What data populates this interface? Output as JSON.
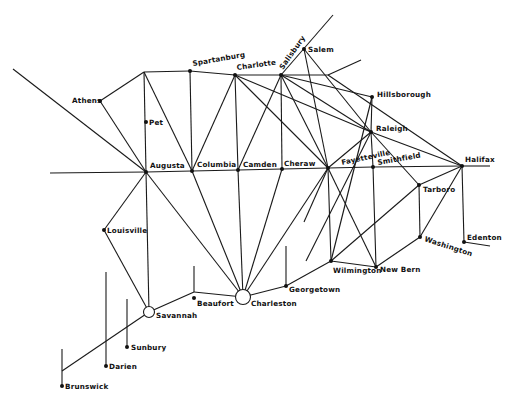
{
  "diagram": {
    "type": "network-map",
    "colors": {
      "line": "#1a1a1a",
      "node": "#111111",
      "background": "#ffffff"
    },
    "nodes": [
      {
        "id": "athens",
        "label": "Athens",
        "x": 100,
        "y": 101,
        "lx": 72,
        "ly": 103,
        "kind": "dot"
      },
      {
        "id": "pet",
        "label": "Pet",
        "x": 146,
        "y": 122,
        "lx": 149,
        "ly": 125,
        "kind": "dot"
      },
      {
        "id": "augusta",
        "label": "Augusta",
        "x": 146,
        "y": 172,
        "lx": 150,
        "ly": 168,
        "kind": "dot"
      },
      {
        "id": "spartanburg",
        "label": "Spartanburg",
        "x": 190,
        "y": 71,
        "lx": 193,
        "ly": 66,
        "kind": "dot",
        "rotate": -10
      },
      {
        "id": "charlotte",
        "label": "Charlotte",
        "x": 235,
        "y": 75,
        "lx": 237,
        "ly": 70,
        "kind": "dot",
        "rotate": -8
      },
      {
        "id": "salisbury",
        "label": "Salisbury",
        "x": 281,
        "y": 75,
        "lx": 283,
        "ly": 70,
        "kind": "dot",
        "rotate": -55
      },
      {
        "id": "salem",
        "label": "Salem",
        "x": 304,
        "y": 49,
        "lx": 308,
        "ly": 52,
        "kind": "dot"
      },
      {
        "id": "hillsborough",
        "label": "Hillsborough",
        "x": 372,
        "y": 97,
        "lx": 377,
        "ly": 97,
        "kind": "dot"
      },
      {
        "id": "raleigh",
        "label": "Raleigh",
        "x": 371,
        "y": 132,
        "lx": 376,
        "ly": 131,
        "kind": "dot"
      },
      {
        "id": "fayetteville",
        "label": "Fayetteville",
        "x": 328,
        "y": 168,
        "lx": 342,
        "ly": 165,
        "kind": "dot",
        "rotate": -12
      },
      {
        "id": "smithfield",
        "label": "Smithfield",
        "x": 373,
        "y": 167,
        "lx": 378,
        "ly": 165,
        "kind": "dot",
        "rotate": -10
      },
      {
        "id": "halifax",
        "label": "Halifax",
        "x": 462,
        "y": 166,
        "lx": 465,
        "ly": 162,
        "kind": "dot"
      },
      {
        "id": "tarboro",
        "label": "Tarboro",
        "x": 419,
        "y": 185,
        "lx": 423,
        "ly": 192,
        "kind": "dot"
      },
      {
        "id": "washington",
        "label": "Washington",
        "x": 420,
        "y": 237,
        "lx": 424,
        "ly": 241,
        "kind": "dot",
        "rotate": 18
      },
      {
        "id": "edenton",
        "label": "Edenton",
        "x": 464,
        "y": 242,
        "lx": 467,
        "ly": 240,
        "kind": "dot"
      },
      {
        "id": "wilmington",
        "label": "Wilmington",
        "x": 331,
        "y": 261,
        "lx": 333,
        "ly": 273,
        "kind": "dot"
      },
      {
        "id": "newbern",
        "label": "New Bern",
        "x": 376,
        "y": 267,
        "lx": 380,
        "ly": 272,
        "kind": "dot"
      },
      {
        "id": "georgetown",
        "label": "Georgetown",
        "x": 286,
        "y": 286,
        "lx": 289,
        "ly": 292,
        "kind": "dot"
      },
      {
        "id": "charleston",
        "label": "Charleston",
        "x": 243,
        "y": 297,
        "lx": 251,
        "ly": 306,
        "kind": "hub",
        "r": 7.5
      },
      {
        "id": "beaufort",
        "label": "Beaufort",
        "x": 194,
        "y": 298,
        "lx": 197,
        "ly": 306,
        "kind": "dot"
      },
      {
        "id": "savannah",
        "label": "Savannah",
        "x": 149,
        "y": 312,
        "lx": 156,
        "ly": 318,
        "kind": "hub",
        "r": 5.5
      },
      {
        "id": "louisville",
        "label": "Louisville",
        "x": 104,
        "y": 230,
        "lx": 107,
        "ly": 233,
        "kind": "dot"
      },
      {
        "id": "sunbury",
        "label": "Sunbury",
        "x": 127,
        "y": 347,
        "lx": 131,
        "ly": 350,
        "kind": "dot"
      },
      {
        "id": "darien",
        "label": "Darien",
        "x": 106,
        "y": 366,
        "lx": 109,
        "ly": 369,
        "kind": "dot"
      },
      {
        "id": "brunswick",
        "label": "Brunswick",
        "x": 62,
        "y": 386,
        "lx": 65,
        "ly": 389,
        "kind": "dot"
      },
      {
        "id": "columbia",
        "label": "Columbia",
        "x": 192,
        "y": 171,
        "lx": 197,
        "ly": 167,
        "kind": "dot"
      },
      {
        "id": "camden",
        "label": "Camden",
        "x": 238,
        "y": 170,
        "lx": 243,
        "ly": 167,
        "kind": "dot"
      },
      {
        "id": "cheraw",
        "label": "Cheraw",
        "x": 282,
        "y": 169,
        "lx": 284,
        "ly": 166,
        "kind": "dot"
      }
    ],
    "edges": [
      [
        13,
        69,
        146,
        172
      ],
      [
        50,
        173,
        146,
        172
      ],
      [
        146,
        172,
        192,
        171
      ],
      [
        192,
        171,
        238,
        170
      ],
      [
        238,
        170,
        282,
        169
      ],
      [
        282,
        169,
        328,
        168
      ],
      [
        328,
        168,
        373,
        167
      ],
      [
        373,
        167,
        462,
        166
      ],
      [
        462,
        166,
        490,
        166
      ],
      [
        144,
        72,
        190,
        71
      ],
      [
        190,
        71,
        235,
        75
      ],
      [
        235,
        75,
        281,
        75
      ],
      [
        281,
        75,
        328,
        75
      ],
      [
        328,
        75,
        361,
        60
      ],
      [
        281,
        75,
        333,
        15
      ],
      [
        144,
        72,
        100,
        101
      ],
      [
        100,
        101,
        146,
        172
      ],
      [
        144,
        72,
        146,
        172
      ],
      [
        144,
        72,
        192,
        171
      ],
      [
        190,
        71,
        192,
        171
      ],
      [
        235,
        75,
        192,
        171
      ],
      [
        235,
        75,
        238,
        170
      ],
      [
        235,
        75,
        328,
        168
      ],
      [
        235,
        75,
        371,
        132
      ],
      [
        281,
        75,
        238,
        170
      ],
      [
        281,
        75,
        282,
        169
      ],
      [
        281,
        75,
        328,
        168
      ],
      [
        281,
        75,
        372,
        97
      ],
      [
        281,
        75,
        371,
        132
      ],
      [
        304,
        49,
        328,
        168
      ],
      [
        304,
        49,
        371,
        132
      ],
      [
        328,
        75,
        462,
        166
      ],
      [
        372,
        97,
        371,
        132
      ],
      [
        372,
        97,
        331,
        261
      ],
      [
        371,
        132,
        328,
        168
      ],
      [
        371,
        132,
        462,
        166
      ],
      [
        371,
        132,
        419,
        185
      ],
      [
        371,
        132,
        306,
        261
      ],
      [
        371,
        132,
        373,
        167
      ],
      [
        373,
        167,
        376,
        267
      ],
      [
        328,
        168,
        331,
        261
      ],
      [
        328,
        168,
        376,
        267
      ],
      [
        328,
        168,
        243,
        297
      ],
      [
        328,
        168,
        304,
        222
      ],
      [
        282,
        169,
        243,
        297
      ],
      [
        238,
        170,
        243,
        297
      ],
      [
        192,
        171,
        243,
        297
      ],
      [
        146,
        172,
        243,
        297
      ],
      [
        146,
        172,
        104,
        230
      ],
      [
        104,
        230,
        149,
        312
      ],
      [
        146,
        172,
        149,
        312
      ],
      [
        462,
        166,
        419,
        185
      ],
      [
        462,
        166,
        420,
        237
      ],
      [
        462,
        166,
        464,
        242
      ],
      [
        464,
        242,
        490,
        246
      ],
      [
        419,
        185,
        420,
        237
      ],
      [
        419,
        185,
        331,
        261
      ],
      [
        420,
        237,
        376,
        267
      ],
      [
        376,
        267,
        331,
        261
      ],
      [
        331,
        261,
        286,
        286
      ],
      [
        286,
        286,
        243,
        297
      ],
      [
        286,
        286,
        286,
        246
      ],
      [
        243,
        297,
        194,
        292
      ],
      [
        194,
        292,
        194,
        266
      ],
      [
        194,
        292,
        149,
        312
      ],
      [
        149,
        312,
        62,
        371
      ],
      [
        62,
        349,
        62,
        386
      ],
      [
        106,
        272,
        106,
        366
      ],
      [
        127,
        299,
        127,
        347
      ]
    ]
  }
}
